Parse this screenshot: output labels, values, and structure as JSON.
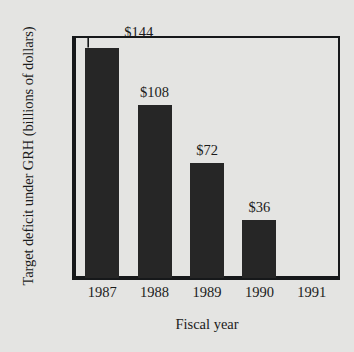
{
  "chart_data": {
    "type": "bar",
    "title": "",
    "xlabel": "Fiscal year",
    "ylabel": "Target deficit under GRH (billions of dollars)",
    "categories": [
      "1987",
      "1988",
      "1989",
      "1990",
      "1991"
    ],
    "values": [
      144,
      108,
      72,
      36,
      0
    ],
    "value_labels": [
      "$144",
      "$108",
      "$72",
      "$36",
      ""
    ],
    "ylim": [
      0,
      150
    ],
    "yticks": [
      0,
      25,
      50,
      75,
      100,
      125,
      150
    ],
    "ytick_labels": [
      "$0",
      "$25",
      "$50",
      "$75",
      "$100",
      "$125",
      "$150"
    ],
    "grid": false,
    "legend": null,
    "series": [
      {
        "name": "Target deficit under GRH",
        "values": [
          144,
          108,
          72,
          36,
          0
        ]
      }
    ],
    "annotations": [
      {
        "text": "$144",
        "category": "1987",
        "style": "leader-line"
      }
    ],
    "colors": {
      "bar_fill": "#262626",
      "axis": "#16181a",
      "background": "#e4e4e2",
      "text": "#1b1b1b"
    }
  }
}
